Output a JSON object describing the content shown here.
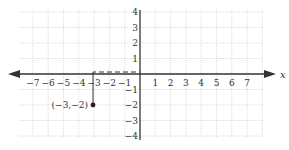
{
  "diagram": {
    "x_axis_label": "x",
    "x_ticks": [
      "−7",
      "−6",
      "−5",
      "−4",
      "−3",
      "−2",
      "−1",
      "1",
      "2",
      "3",
      "4",
      "5",
      "6",
      "7"
    ],
    "y_ticks": [
      "4",
      "3",
      "2",
      "1",
      "−1",
      "−2",
      "−3",
      "−4"
    ],
    "point": {
      "label": "(−3,−2)",
      "x": -3,
      "y": -2
    },
    "colors": {
      "axis": "#333333",
      "grid": "#bbbbbb",
      "point": "#222222"
    }
  }
}
